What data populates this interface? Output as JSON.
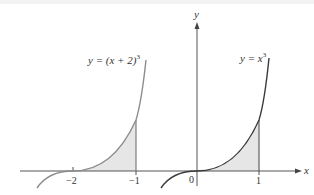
{
  "figure": {
    "left_graph": {
      "equation": "y = (x + 2)",
      "exponent": "3",
      "tick_labels": [
        "−2",
        "−1"
      ],
      "shaded_interval": [
        -2,
        -1
      ],
      "curve_color": "#8c8c8c"
    },
    "right_graph": {
      "equation": "y = x",
      "exponent": "3",
      "tick_labels": [
        "0",
        "1"
      ],
      "shaded_interval": [
        0,
        1
      ],
      "curve_color": "#3a3a3a"
    },
    "axes": {
      "x_label": "x",
      "y_label": "y",
      "color": "#555555"
    },
    "shade_color": "#e6e6e6"
  }
}
